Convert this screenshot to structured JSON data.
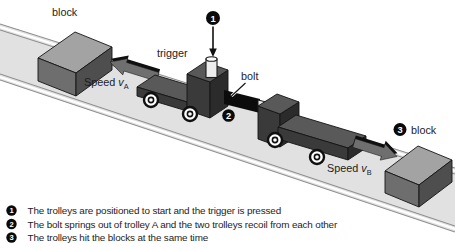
{
  "figure": {
    "labels": {
      "block_left": "block",
      "trigger": "trigger",
      "bolt": "bolt",
      "speed_a": {
        "text": "Speed",
        "var": "v",
        "sub": "A"
      },
      "speed_b": {
        "text": "Speed",
        "var": "v",
        "sub": "B"
      },
      "block_right": "block"
    },
    "markers": {
      "m1": "1",
      "m2": "2",
      "m3": "3"
    },
    "legend": {
      "items": [
        {
          "num": "1",
          "text": "The trolleys are positioned to start and the trigger is pressed"
        },
        {
          "num": "2",
          "text": "The bolt springs out of trolley A and the two trolleys recoil from each other"
        },
        {
          "num": "3",
          "text": "The trolleys hit the blocks at the same time"
        }
      ]
    },
    "colors": {
      "track": "#e1e1e1",
      "track_line": "#8e8e8e",
      "block_top": "#a3a3a3",
      "block_left_face": "#6e6e6e",
      "block_right_face": "#4e4e4e",
      "trolley_top": "#595959",
      "trolley_front": "#3a3a3a",
      "trolley_side": "#2b2b2b",
      "arrow_face": "#6f6f6f",
      "arrow_top": "#0f0f0f",
      "bolt_rod": "#0c0c0c",
      "bolt_tip": "#e9e9e9",
      "trigger_body": "#ededed",
      "marker_bg": "#0a0a0a",
      "text": "#1c1c1c"
    }
  }
}
